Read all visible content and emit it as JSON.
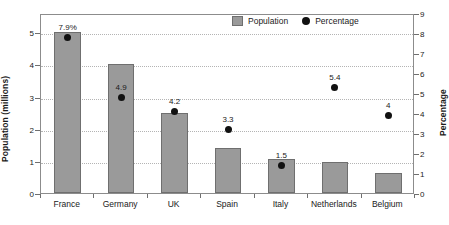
{
  "chart_data": {
    "type": "bar",
    "title": "",
    "categories": [
      "France",
      "Germany",
      "UK",
      "Spain",
      "Italy",
      "Netherlands",
      "Belgium"
    ],
    "series": [
      {
        "name": "Population",
        "type": "bar",
        "axis": "left",
        "values": [
          5.0,
          4.0,
          2.5,
          1.4,
          1.05,
          0.95,
          0.62
        ]
      },
      {
        "name": "Percentage",
        "type": "scatter",
        "axis": "right",
        "values": [
          7.9,
          4.9,
          4.2,
          3.3,
          1.5,
          5.4,
          4.0
        ],
        "point_labels": [
          "7.9%",
          "4.9",
          "4.2",
          "3.3",
          "1.5",
          "5.4",
          "4"
        ]
      }
    ],
    "xlabel": "",
    "ylabel": "Population (millions)",
    "ylabel_right": "Percentage",
    "ylim": [
      0,
      5.6
    ],
    "ylim_right": [
      0,
      9
    ],
    "yticks": [
      "0",
      "1",
      "2",
      "3",
      "4",
      "5"
    ],
    "yticks_right": [
      "0",
      "1",
      "2",
      "3",
      "4",
      "5",
      "6",
      "7",
      "8",
      "9"
    ],
    "grid": true,
    "legend_position": "top-right",
    "legend": [
      "Population",
      "Percentage"
    ],
    "colors": {
      "bar_fill": "#9a9a9a",
      "bar_edge": "#6f6f6f",
      "dot": "#111111",
      "grid": "#b4b4b4",
      "frame": "#8c8c8c"
    }
  }
}
